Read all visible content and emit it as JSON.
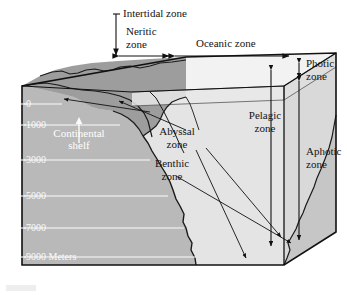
{
  "figure": {
    "type": "cross-section-block-diagram"
  },
  "top_labels": {
    "intertidal": "Intertidal zone",
    "neritic_line1": "Neritic",
    "neritic_line2": "zone",
    "oceanic": "Oceanic zone"
  },
  "right_labels": {
    "photic_line1": "Photic",
    "photic_line2": "zone",
    "aphotic_line1": "Aphotic",
    "aphotic_line2": "zone"
  },
  "interior_labels": {
    "pelagic_line1": "Pelagic",
    "pelagic_line2": "zone",
    "abyssal_line1": "Abyssal",
    "abyssal_line2": "zone",
    "benthic_line1": "Benthic",
    "benthic_line2": "zone",
    "continental_line1": "Continental",
    "continental_line2": "shelf"
  },
  "depth_scale": {
    "unit": "Meters",
    "ticks": [
      {
        "label": "0",
        "value": 0
      },
      {
        "label": "1000",
        "value": 1000
      },
      {
        "label": "3000",
        "value": 3000
      },
      {
        "label": "5000",
        "value": 5000
      },
      {
        "label": "7000",
        "value": 7000
      },
      {
        "label": "9000 Meters",
        "value": 9000
      }
    ]
  },
  "colors": {
    "land_surface": "#9d9d9d",
    "rock_face": "#b9b9b9",
    "rock_side": "#a8a8a8",
    "water_front": "#e4e4e4",
    "water_side": "#d9d9d9",
    "ocean_surface": "#f2f2f2",
    "photic_slab": "#e9e9e9",
    "outline": "#111111",
    "scale_text": "#fbfbfb",
    "label_text": "#141414"
  }
}
